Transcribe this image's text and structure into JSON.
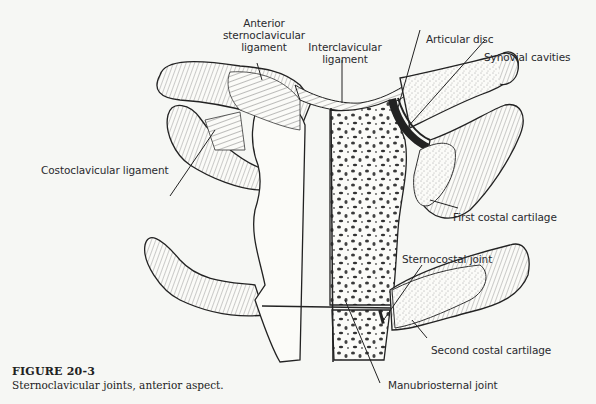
{
  "figure": {
    "number_label": "FIGURE 20-3",
    "caption": "Sternoclavicular joints, anterior aspect.",
    "subject": "Sternoclavicular joints",
    "view": "anterior aspect"
  },
  "labels": {
    "anterior_sternoclavicular_ligament": [
      "Anterior",
      "sternoclavicular",
      "ligament"
    ],
    "interclavicular_ligament": [
      "Interclavicular",
      "ligament"
    ],
    "articular_disc": "Articular disc",
    "synovial_cavities": "Synovial cavities",
    "costoclavicular_ligament": "Costoclavicular ligament",
    "first_costal_cartilage": "First costal cartilage",
    "sternocostal_joint": "Sternocostal joint",
    "second_costal_cartilage": "Second costal cartilage",
    "manubriosternal_joint": "Manubriosternal joint"
  },
  "colors": {
    "background": "#f6f7f4",
    "ink": "#2a2a2e",
    "bone_fill": "#fbfbf8",
    "marrow_dot": "#3a3a3a"
  }
}
